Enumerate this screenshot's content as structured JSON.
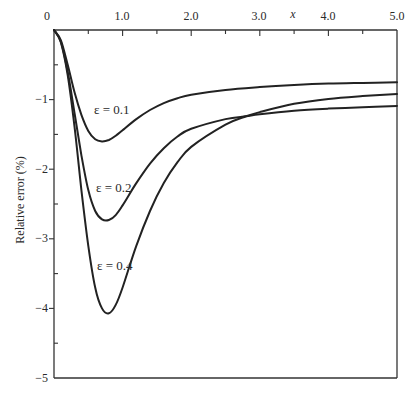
{
  "chart_data": {
    "type": "line",
    "title": "",
    "xlabel": "x",
    "ylabel": "Relative error (%)",
    "xlim": [
      0,
      5.0
    ],
    "ylim": [
      -5,
      0
    ],
    "x_ticks": [
      "0",
      "1.0",
      "2.0",
      "3.0",
      "4.0",
      "5.0"
    ],
    "y_ticks": [
      "-1",
      "-2",
      "-3",
      "-4",
      "-5"
    ],
    "x_axis_position": "top",
    "grid": false,
    "legend": null,
    "series": [
      {
        "name": "ε = 0.1",
        "x": [
          0,
          0.1,
          0.2,
          0.3,
          0.4,
          0.5,
          0.6,
          0.7,
          0.8,
          0.9,
          1.0,
          1.2,
          1.4,
          1.6,
          1.8,
          2.0,
          2.5,
          3.0,
          3.5,
          4.0,
          4.5,
          5.0
        ],
        "y": [
          0,
          -0.15,
          -0.5,
          -0.9,
          -1.22,
          -1.45,
          -1.57,
          -1.6,
          -1.58,
          -1.52,
          -1.44,
          -1.28,
          -1.15,
          -1.05,
          -0.98,
          -0.93,
          -0.86,
          -0.82,
          -0.79,
          -0.77,
          -0.76,
          -0.75
        ]
      },
      {
        "name": "ε = 0.2",
        "x": [
          0,
          0.1,
          0.2,
          0.3,
          0.4,
          0.5,
          0.6,
          0.7,
          0.8,
          0.9,
          1.0,
          1.2,
          1.4,
          1.6,
          1.8,
          2.0,
          2.5,
          2.8,
          3.0,
          3.5,
          4.0,
          4.5,
          5.0
        ],
        "y": [
          0,
          -0.17,
          -0.6,
          -1.2,
          -1.8,
          -2.3,
          -2.6,
          -2.72,
          -2.73,
          -2.66,
          -2.52,
          -2.2,
          -1.92,
          -1.7,
          -1.53,
          -1.42,
          -1.28,
          -1.24,
          -1.21,
          -1.16,
          -1.13,
          -1.11,
          -1.09
        ]
      },
      {
        "name": "ε = 0.4",
        "x": [
          0,
          0.1,
          0.2,
          0.3,
          0.4,
          0.5,
          0.6,
          0.7,
          0.8,
          0.9,
          1.0,
          1.2,
          1.4,
          1.6,
          1.8,
          2.0,
          2.5,
          2.8,
          3.0,
          3.5,
          4.0,
          4.5,
          5.0
        ],
        "y": [
          0,
          -0.18,
          -0.65,
          -1.4,
          -2.3,
          -3.1,
          -3.7,
          -4.0,
          -4.07,
          -3.95,
          -3.7,
          -3.1,
          -2.6,
          -2.2,
          -1.9,
          -1.68,
          -1.36,
          -1.24,
          -1.18,
          -1.06,
          -0.99,
          -0.95,
          -0.92
        ]
      }
    ],
    "annotations": [
      {
        "text": "ε = 0.1",
        "x": 0.58,
        "y": -1.15
      },
      {
        "text": "ε = 0.2",
        "x": 0.63,
        "y": -2.27
      },
      {
        "text": "ε = 0.4",
        "x": 0.69,
        "y": -3.6
      }
    ]
  },
  "labels": {
    "x_axis_title": "x",
    "y_axis_title": "Relative error (%)",
    "x_ticks": [
      "0",
      "1.0",
      "2.0",
      "3.0",
      "4.0",
      "5.0"
    ],
    "y_ticks": [
      "−1",
      "−2",
      "−3",
      "−4",
      "−5"
    ],
    "curve_labels": [
      "ε = 0.1",
      "ε = 0.2",
      "ε = 0.4"
    ]
  },
  "colors": {
    "line": "#222222",
    "axis": "#333333",
    "background": "#ffffff"
  }
}
